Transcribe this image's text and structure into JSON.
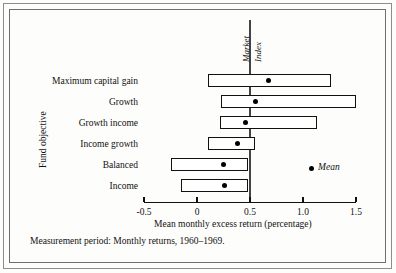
{
  "figure": {
    "caption": "Measurement period: Monthly returns, 1960–1969.",
    "market_line_label_1": "Market",
    "market_line_label_2": "Index",
    "legend_label": "Mean"
  },
  "chart_data": {
    "type": "bar",
    "orientation": "horizontal",
    "title": "",
    "xlabel": "Mean monthly excess return (percentage)",
    "ylabel": "Fund objective",
    "xlim": [
      -0.5,
      1.5
    ],
    "xticks": [
      -0.5,
      0,
      0.5,
      1.0,
      1.5
    ],
    "xticklabels": [
      "-0.5",
      "0",
      "0.5",
      "1.0",
      "1.5"
    ],
    "grid": false,
    "legend": {
      "position": "inside-right",
      "entries": [
        {
          "name": "Mean",
          "marker": "dot"
        }
      ]
    },
    "annotations": [
      {
        "type": "vline",
        "value": 0.5,
        "label": "Market Index"
      }
    ],
    "categories": [
      "Maximum capital gain",
      "Growth",
      "Growth income",
      "Income growth",
      "Balanced",
      "Income"
    ],
    "ranges": [
      {
        "category": "Maximum capital gain",
        "low": 0.1,
        "high": 1.26,
        "mean": 0.67
      },
      {
        "category": "Growth",
        "low": 0.23,
        "high": 1.5,
        "mean": 0.55
      },
      {
        "category": "Growth income",
        "low": 0.22,
        "high": 1.13,
        "mean": 0.46
      },
      {
        "category": "Income growth",
        "low": 0.1,
        "high": 0.55,
        "mean": 0.38
      },
      {
        "category": "Balanced",
        "low": -0.25,
        "high": 0.48,
        "mean": 0.25
      },
      {
        "category": "Income",
        "low": -0.15,
        "high": 0.48,
        "mean": 0.26
      }
    ]
  }
}
